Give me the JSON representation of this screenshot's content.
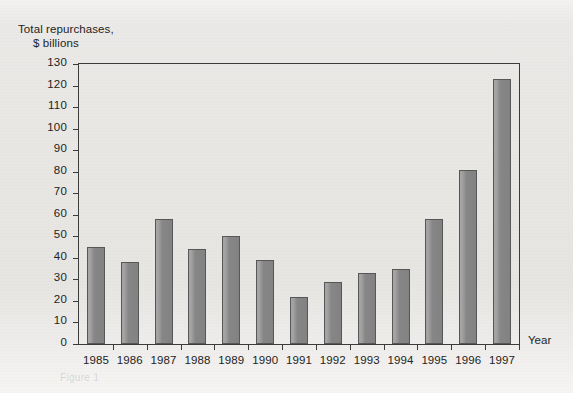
{
  "figure": {
    "axis_title_line1": "Total repurchases,",
    "axis_title_line2": "$ billions",
    "x_axis_title": "Year",
    "caption_ghost": "Figure 1",
    "colors": {
      "bar_fill": "#8d8d8d",
      "bar_edge": "#575757",
      "frame": "#3b3b3b",
      "background": "#e9e8e5",
      "text": "#232323"
    }
  },
  "chart_data": {
    "type": "bar",
    "title": "",
    "subtitle": "",
    "xlabel": "Year",
    "ylabel": "Total repurchases, $ billions",
    "categories": [
      "1985",
      "1986",
      "1987",
      "1988",
      "1989",
      "1990",
      "1991",
      "1992",
      "1993",
      "1994",
      "1995",
      "1996",
      "1997"
    ],
    "values": [
      45,
      38,
      58,
      44,
      50,
      39,
      22,
      29,
      33,
      35,
      58,
      81,
      123
    ],
    "ylim": [
      0,
      130
    ],
    "ytick_step": 10,
    "yticks": [
      0,
      10,
      20,
      30,
      40,
      50,
      60,
      70,
      80,
      90,
      100,
      110,
      120,
      130
    ],
    "ytick_labels": [
      "0",
      "10",
      "20",
      "30",
      "40",
      "50",
      "60",
      "70",
      "80",
      "90",
      "100",
      "110",
      "120",
      "130"
    ],
    "grid": false,
    "legend": null,
    "legend_position": "none",
    "series": [
      {
        "name": "Total repurchases",
        "values": [
          45,
          38,
          58,
          44,
          50,
          39,
          22,
          29,
          33,
          35,
          58,
          81,
          123
        ]
      }
    ],
    "annotations": []
  }
}
